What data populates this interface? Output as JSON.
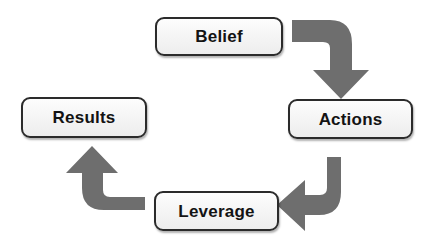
{
  "diagram": {
    "type": "cycle-flowchart",
    "orientation": "clockwise",
    "canvas": {
      "width": 427,
      "height": 248,
      "background": "#ffffff"
    },
    "colors": {
      "node_fill": "#f4f4f4",
      "node_border": "#2b2b2b",
      "node_text": "#131313",
      "arrow": "#6e6e6e"
    },
    "nodes": [
      {
        "id": "belief",
        "label": "Belief",
        "position": "top"
      },
      {
        "id": "actions",
        "label": "Actions",
        "position": "right"
      },
      {
        "id": "leverage",
        "label": "Leverage",
        "position": "bottom"
      },
      {
        "id": "results",
        "label": "Results",
        "position": "left"
      }
    ],
    "arrows": [
      {
        "id": "belief-to-actions",
        "from": "belief",
        "to": "actions",
        "icon": "curved-arrow-down-right",
        "points": "down"
      },
      {
        "id": "actions-to-leverage",
        "from": "actions",
        "to": "leverage",
        "icon": "curved-arrow-down-left",
        "points": "left"
      },
      {
        "id": "leverage-to-results",
        "from": "leverage",
        "to": "results",
        "icon": "curved-arrow-up-left",
        "points": "up"
      }
    ]
  }
}
